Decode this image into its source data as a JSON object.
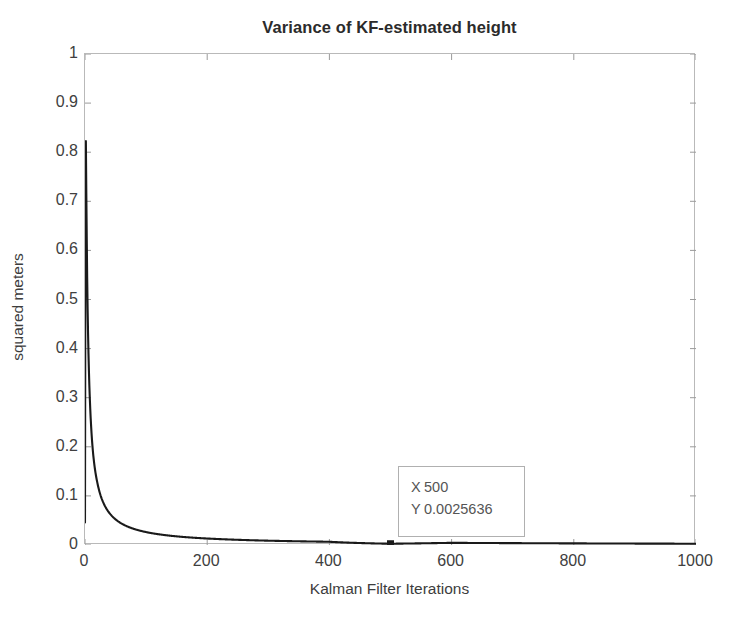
{
  "chart_data": {
    "type": "line",
    "title": "Variance of KF-estimated height",
    "xlabel": "Kalman Filter Iterations",
    "ylabel": "squared meters",
    "xlim": [
      0,
      1000
    ],
    "ylim": [
      0,
      1
    ],
    "grid": false,
    "legend": null,
    "xticks": [
      "0",
      "200",
      "400",
      "600",
      "800",
      "1000"
    ],
    "xtick_values": [
      0,
      200,
      400,
      600,
      800,
      1000
    ],
    "yticks": [
      "0",
      "0.1",
      "0.2",
      "0.3",
      "0.4",
      "0.5",
      "0.6",
      "0.7",
      "0.8",
      "0.9",
      "1"
    ],
    "ytick_values": [
      0,
      0.1,
      0.2,
      0.3,
      0.4,
      0.5,
      0.6,
      0.7,
      0.8,
      0.9,
      1
    ],
    "line_color": "#1a1a1a",
    "line_width": 2.1,
    "series": [
      {
        "name": "KF height variance",
        "x": [
          1,
          2,
          3,
          4,
          5,
          6,
          8,
          10,
          13,
          16,
          20,
          25,
          30,
          40,
          50,
          65,
          80,
          100,
          125,
          150,
          200,
          250,
          300,
          400,
          500,
          600,
          700,
          800,
          900,
          1000
        ],
        "values": [
          0.92,
          0.74,
          0.61,
          0.505,
          0.43,
          0.375,
          0.295,
          0.242,
          0.19,
          0.157,
          0.128,
          0.103,
          0.0862,
          0.065,
          0.0522,
          0.0403,
          0.0328,
          0.0263,
          0.0211,
          0.0176,
          0.0132,
          0.0106,
          0.0088,
          0.0066,
          0.0025636,
          0.0044,
          0.0038,
          0.0033,
          0.0029,
          0.0026
        ]
      }
    ],
    "annotation": {
      "type": "datatip",
      "x_label": "X",
      "x_value": "500",
      "y_label": "Y",
      "y_value": "0.0025636",
      "marker_x": 500,
      "marker_y": 0.0025636,
      "marker_color": "#1a1a1a"
    }
  }
}
